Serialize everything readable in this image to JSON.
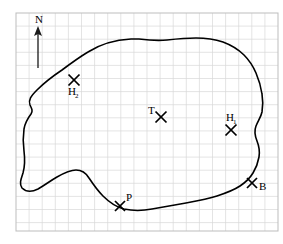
{
  "figure": {
    "frame": {
      "x": 16,
      "y": 13,
      "width": 262,
      "height": 218
    },
    "grid": {
      "spacing": 13.1,
      "color": "#d9d9d9",
      "border_color": "#bdbdbd"
    },
    "ink_color": "#000000"
  },
  "north_arrow": {
    "label": "N",
    "label_x": 39,
    "label_y": 23,
    "shaft_x": 38,
    "shaft_top": 28,
    "shaft_bottom": 68,
    "head_size": 5
  },
  "shoreline": {
    "name": "lake-outline",
    "stroke_width": 1.6,
    "path": "M 131 39 C 112 40 99 45 88 52 C 78 58 70 64 62 70 C 53 76 44 83 37 90 C 31 96 28 100 30 105 C 32 109 33 111 31 114 C 28 118 25 123 24 129 C 23 136 23 144 24 151 C 25 159 25 166 23 173 C 21 179 19 184 22 188 C 26 192 32 192 38 189 C 45 185 50 181 57 177 C 64 173 70 170 76 170 C 82 170 86 173 89 178 C 93 184 97 190 103 196 C 109 202 116 207 124 209 C 133 211 142 211 152 209 C 163 207 175 205 186 203 C 197 201 208 199 217 196 C 226 193 234 190 240 186 C 246 182 250 178 253 173 C 256 168 258 163 259 157 C 260 151 259 146 257 141 C 255 136 254 131 256 126 C 258 121 261 117 262 112 C 263 106 263 100 262 94 C 261 87 259 80 256 73 C 253 66 249 60 244 55 C 238 49 231 45 223 42 C 214 39 205 38 196 38 C 186 38 176 39 167 40 C 157 41 147 40 139 39 C 136 39 133 39 131 39 Z"
  },
  "markers": [
    {
      "id": "marker-h2",
      "label": "H",
      "subscript": "2",
      "cross_x": 74,
      "cross_y": 80,
      "cross_size": 5.5,
      "label_x": 68,
      "label_y": 95,
      "sub_dx": 7,
      "sub_dy": 3
    },
    {
      "id": "marker-t",
      "label": "T",
      "subscript": "",
      "cross_x": 161,
      "cross_y": 117,
      "cross_size": 5.5,
      "label_x": 148,
      "label_y": 114,
      "sub_dx": 0,
      "sub_dy": 0
    },
    {
      "id": "marker-h1",
      "label": "H",
      "subscript": "1",
      "cross_x": 231,
      "cross_y": 130,
      "cross_size": 5.5,
      "label_x": 229,
      "label_y": 121,
      "sub_dx": 7,
      "sub_dy": 3
    },
    {
      "id": "marker-p",
      "label": "P",
      "subscript": "",
      "cross_x": 120,
      "cross_y": 206,
      "cross_size": 5,
      "label_x": 126,
      "label_y": 201,
      "sub_dx": 0,
      "sub_dy": 0
    },
    {
      "id": "marker-b",
      "label": "B",
      "subscript": "",
      "cross_x": 252,
      "cross_y": 183,
      "cross_size": 5,
      "label_x": 259,
      "label_y": 190,
      "sub_dx": 0,
      "sub_dy": 0
    }
  ]
}
